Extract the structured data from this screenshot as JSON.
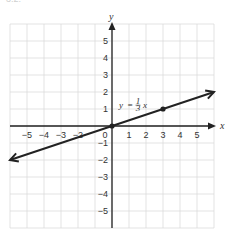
{
  "header_fragment": "3.2.",
  "chart_data": {
    "type": "line",
    "title": "",
    "xlabel": "x",
    "ylabel": "y",
    "xlim": [
      -6,
      6
    ],
    "ylim": [
      -6,
      6
    ],
    "grid": true,
    "x_ticks": [
      "−5",
      "−4",
      "−3",
      "−2",
      "0",
      "1",
      "2",
      "3",
      "4",
      "5"
    ],
    "y_ticks": [
      "5",
      "4",
      "3",
      "2",
      "1",
      "−1",
      "−2",
      "−3",
      "−4",
      "−5"
    ],
    "origin_label": "0",
    "series": [
      {
        "name": "y = 1/3 x",
        "equation": "y = (1/3)x",
        "x": [
          -6,
          0,
          3,
          6
        ],
        "y": [
          -2,
          0,
          1,
          2
        ],
        "arrows_both_ends": true,
        "marked_points": [
          [
            0,
            0
          ],
          [
            3,
            1
          ]
        ]
      }
    ],
    "annotations": [
      {
        "text_y": "y",
        "text_eq": "=",
        "frac_num": "1",
        "frac_den": "3",
        "text_x": "x",
        "at": [
          1.3,
          1
        ]
      }
    ]
  }
}
